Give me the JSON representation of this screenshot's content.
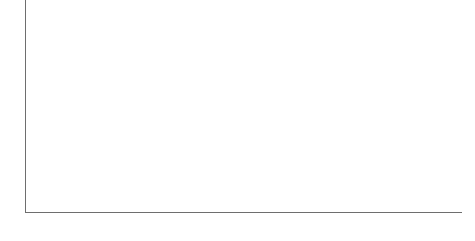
{
  "chart_data": {
    "type": "bar",
    "orientation": "horizontal",
    "title": "",
    "xlabel": "",
    "ylabel": "",
    "xlim": [
      0,
      100
    ],
    "xticks": [
      0,
      20,
      40,
      60,
      80,
      100
    ],
    "grid": false,
    "legend": false,
    "groups": [
      {
        "name": "Gender",
        "color": "#8c8c8c",
        "categories": [
          "Male",
          "Female"
        ],
        "values": [
          55,
          69
        ]
      },
      {
        "name": "Race",
        "color": "#6e6e6e",
        "categories": [
          "White",
          "Nonwhite"
        ],
        "values": [
          62,
          65
        ]
      },
      {
        "name": "Political party",
        "color": "#565656",
        "categories": [
          "Democrat",
          "Independent",
          "Republican"
        ],
        "values": [
          70,
          66,
          53
        ]
      },
      {
        "name": "Ideology",
        "color": "#bcbcbc",
        "categories": [
          "Very conservative",
          "Conservative",
          "Moderate",
          "Liberal",
          "Very liberal"
        ],
        "values": [
          29,
          52,
          64,
          79,
          85
        ]
      }
    ],
    "bars": [
      {
        "label": "Male",
        "value": 55,
        "group": "Gender",
        "color": "#8c8c8c"
      },
      {
        "label": "Female",
        "value": 69,
        "group": "Gender",
        "color": "#8c8c8c"
      },
      {
        "label": "White",
        "value": 62,
        "group": "Race",
        "color": "#6e6e6e"
      },
      {
        "label": "Nonwhite",
        "value": 65,
        "group": "Race",
        "color": "#6e6e6e"
      },
      {
        "label": "Democrat",
        "value": 70,
        "group": "Political party",
        "color": "#565656"
      },
      {
        "label": "Independent",
        "value": 66,
        "group": "Political party",
        "color": "#565656"
      },
      {
        "label": "Republican",
        "value": 53,
        "group": "Political party",
        "color": "#4a4a4a"
      },
      {
        "label": "Very conservative",
        "value": 29,
        "group": "Ideology",
        "color": "#c2c2c2"
      },
      {
        "label": "Conservative",
        "value": 52,
        "group": "Ideology",
        "color": "#c8c8c8"
      },
      {
        "label": "Moderate",
        "value": 64,
        "group": "Ideology",
        "color": "#bcbcbc"
      },
      {
        "label": "Liberal",
        "value": 79,
        "group": "Ideology",
        "color": "#c2c2c2"
      },
      {
        "label": "Very liberal",
        "value": 85,
        "group": "Ideology",
        "color": "#c2c2c2"
      }
    ],
    "axis_color": "#6e6e6e",
    "background_color": "#ffffff"
  },
  "layout": {
    "plot_left_px": 26,
    "plot_width_px": 436,
    "bar_height_px": 14,
    "row_pitch_px": 18,
    "rows_top_px": 2,
    "group_gaps": {
      "after_row_1": 5,
      "after_row_3": 5,
      "after_row_6": 5
    }
  }
}
